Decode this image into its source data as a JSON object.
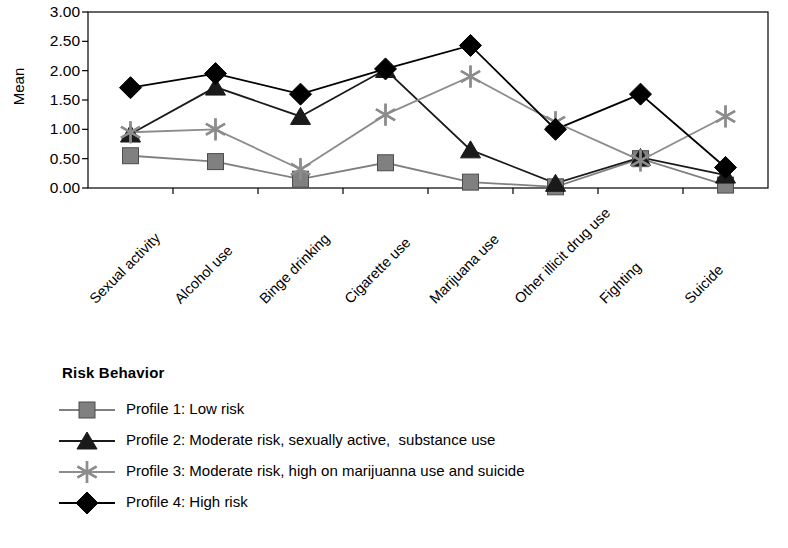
{
  "chart_data": {
    "type": "line",
    "title": "",
    "xlabel": "",
    "ylabel": "Mean",
    "ylim": [
      0,
      3
    ],
    "ytick_labels": [
      "3.00",
      "2.50",
      "2.00",
      "1.50",
      "1.00",
      "0.50",
      "0.00"
    ],
    "ytick_values": [
      3.0,
      2.5,
      2.0,
      1.5,
      1.0,
      0.5,
      0.0
    ],
    "grid": false,
    "legend_position": "below-plot",
    "legend_title": "Risk Behavior",
    "categories": [
      "Sexual activity",
      "Alcohol use",
      "Binge drinking",
      "Cigarette use",
      "Marijuana use",
      "Other illicit drug use",
      "Fighting",
      "Suicide"
    ],
    "series": [
      {
        "name": "Profile 1: Low risk",
        "marker": "square",
        "color": "#808080",
        "values": [
          0.55,
          0.45,
          0.15,
          0.43,
          0.1,
          0.02,
          0.5,
          0.05
        ]
      },
      {
        "name": "Profile 2: Moderate risk, sexually active,  substance use",
        "marker": "triangle",
        "color": "#1a1a1a",
        "values": [
          0.92,
          1.72,
          1.22,
          2.02,
          0.65,
          0.08,
          0.52,
          0.22
        ]
      },
      {
        "name": "Profile 3: Moderate risk, high on marijuanna use and suicide",
        "marker": "asterisk",
        "color": "#8c8c8c",
        "values": [
          0.95,
          1.0,
          0.32,
          1.25,
          1.9,
          1.12,
          0.47,
          1.22
        ]
      },
      {
        "name": "Profile 4: High risk",
        "marker": "diamond",
        "color": "#000000",
        "values": [
          1.71,
          1.95,
          1.6,
          2.03,
          2.43,
          1.0,
          1.6,
          0.35
        ]
      }
    ]
  },
  "axis": {
    "y_title": "Mean"
  },
  "legend": {
    "title": "Risk Behavior",
    "items": [
      {
        "label": "Profile 1: Low risk",
        "marker": "square-marker"
      },
      {
        "label": "Profile 2: Moderate risk, sexually active,  substance use",
        "marker": "triangle-marker"
      },
      {
        "label": "Profile 3: Moderate risk, high on marijuanna use and suicide",
        "marker": "asterisk-marker"
      },
      {
        "label": "Profile 4: High risk",
        "marker": "diamond-marker"
      }
    ]
  }
}
